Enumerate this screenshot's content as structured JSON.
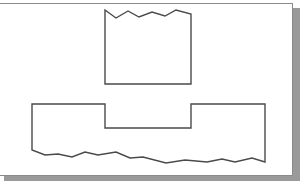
{
  "figure": {
    "colors": {
      "background": "#ffffff",
      "card_border": "#8a8a8a",
      "shadow": "#9a9a9a",
      "stroke": "#4a4a4a"
    },
    "shapes": [
      {
        "name": "upper-block-broken-top",
        "points": "105,10 116,18 128,11 139,17 152,12 165,16 176,10 191,14 191,84 105,84"
      },
      {
        "name": "lower-notched-block-broken-bottom",
        "points": "32,104 105,104 105,128 191,128 191,104 265,104 265,162 252,158 235,162 222,159 207,162 185,160 166,163 143,157 130,158 116,152 98,155 85,152 72,157 58,154 45,155 32,150"
      }
    ]
  }
}
